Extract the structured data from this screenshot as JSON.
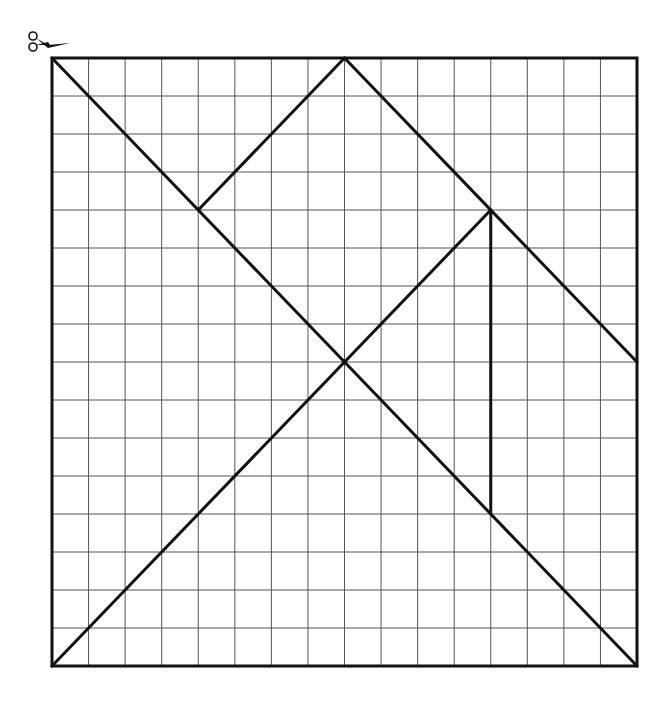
{
  "diagram": {
    "type": "tangram-grid",
    "grid": {
      "columns": 16,
      "rows": 16,
      "origin_px": [
        52,
        58
      ],
      "size_px": [
        585,
        608
      ],
      "grid_line_color": "#555555",
      "border_color": "#111111"
    },
    "cut_lines": [
      {
        "from": [
          0,
          0
        ],
        "to": [
          16,
          16
        ]
      },
      {
        "from": [
          4,
          4
        ],
        "to": [
          8,
          0
        ]
      },
      {
        "from": [
          8,
          0
        ],
        "to": [
          16,
          8
        ]
      },
      {
        "from": [
          0,
          16
        ],
        "to": [
          12,
          4
        ]
      },
      {
        "from": [
          12,
          4
        ],
        "to": [
          12,
          12
        ]
      }
    ],
    "icons": [
      {
        "name": "scissors-icon",
        "position": "top-left-corner"
      }
    ],
    "line_color": "#111111"
  }
}
